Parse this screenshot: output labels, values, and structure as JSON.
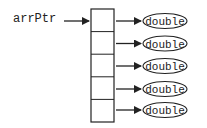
{
  "diagram": {
    "pointer_label": "arrPtr",
    "array_cells": 5,
    "targets": [
      {
        "label": "double"
      },
      {
        "label": "double"
      },
      {
        "label": "double"
      },
      {
        "label": "double"
      },
      {
        "label": "double"
      }
    ],
    "colors": {
      "stroke": "#222222",
      "background": "#ffffff"
    }
  }
}
